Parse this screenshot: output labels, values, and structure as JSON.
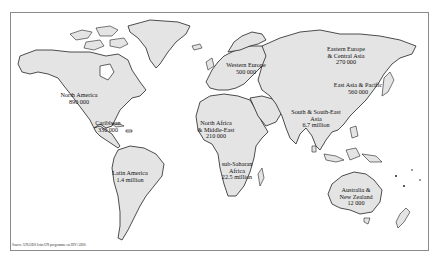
{
  "map": {
    "type": "world choropleth-style label map",
    "land_color": "#e4e4e4",
    "outline_color": "#222222",
    "regions": [
      {
        "id": "north-america",
        "name": "North America",
        "value": "890 000",
        "x": 78,
        "y": 95
      },
      {
        "id": "caribbean",
        "name": "Caribbean",
        "value": "330 000",
        "x": 109,
        "y": 122
      },
      {
        "id": "latin-america",
        "name": "Latin America",
        "value": "1.4 million",
        "x": 128,
        "y": 170
      },
      {
        "id": "western-europe",
        "name": "Western Europe",
        "value": "500 000",
        "x": 243,
        "y": 64
      },
      {
        "id": "eastern-europe-central-asia",
        "name": "Eastern Europe\n& Central Asia",
        "line1": "Eastern Europe",
        "line2": "& Central Asia",
        "value": "270 000",
        "x": 345,
        "y": 48
      },
      {
        "id": "east-asia-pacific",
        "name": "East Asia & Pacific",
        "value": "560 000",
        "x": 358,
        "y": 84
      },
      {
        "id": "north-africa-middle-east",
        "name": "North Africa\n& Middle East",
        "line1": "North Africa",
        "line2": "& Middle-East",
        "value": "210 000",
        "x": 216,
        "y": 122
      },
      {
        "id": "south-southeast-asia",
        "name": "South & South-East\nAsia",
        "line1": "South & South-East",
        "line2": "Asia",
        "value": "6.7 million",
        "x": 316,
        "y": 110
      },
      {
        "id": "sub-saharan-africa",
        "name": "sub-Saharan\nAfrica",
        "line1": "sub-Saharan",
        "line2": "Africa",
        "value": "22.5 million",
        "x": 236,
        "y": 163
      },
      {
        "id": "australia-new-zealand",
        "name": "Australia &\nNew Zealand",
        "line1": "Australia &",
        "line2": "New Zealand",
        "value": "12 000",
        "x": 356,
        "y": 190
      }
    ]
  },
  "source_note": "Source: UNAIDS Joint UN programme on HIV/AIDS."
}
